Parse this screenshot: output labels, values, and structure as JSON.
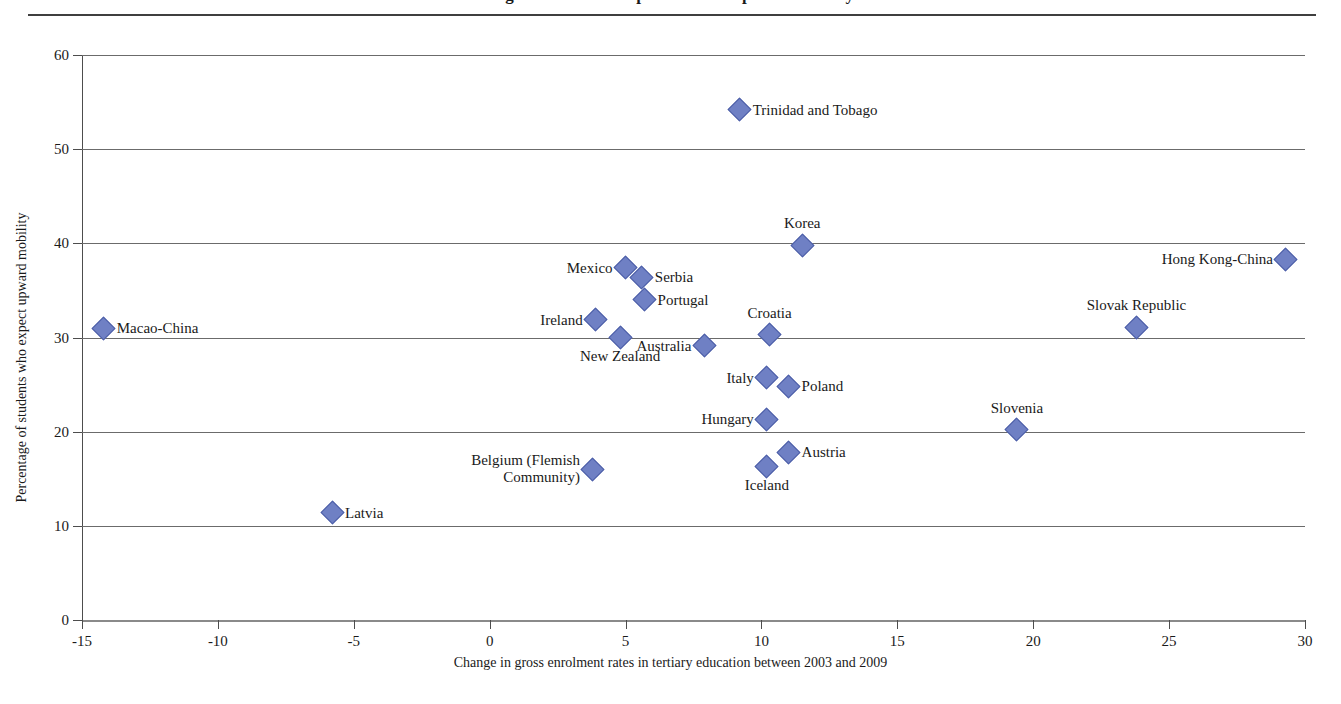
{
  "figure": {
    "title_cropped": "Figure: Students' expectations of upward mobility",
    "top_rule": true
  },
  "chart_data": {
    "type": "scatter",
    "title": "",
    "xlabel": "Change in gross enrolment rates in tertiary education between 2003 and 2009",
    "ylabel": "Percentage of students who expect upward mobility",
    "xlim": [
      -15,
      30
    ],
    "ylim": [
      0,
      60
    ],
    "xticks": [
      -15,
      -10,
      -5,
      0,
      5,
      10,
      15,
      20,
      25,
      30
    ],
    "xticklabels": [
      "-15",
      "-10",
      "-5",
      "0",
      "5",
      "10",
      "15",
      "20",
      "25",
      "30"
    ],
    "yticks": [
      0,
      10,
      20,
      30,
      40,
      50,
      60
    ],
    "yticklabels": [
      "0",
      "10",
      "20",
      "30",
      "40",
      "50",
      "60"
    ],
    "grid": "horizontal",
    "legend": "none",
    "marker": {
      "shape": "diamond",
      "color": "#6f80c4",
      "edge": "#4d5fa8",
      "size": 17
    },
    "points": [
      {
        "label": "Trinidad and Tobago",
        "x": 9.2,
        "y": 54.2,
        "label_pos": "right"
      },
      {
        "label": "Korea",
        "x": 11.5,
        "y": 39.8,
        "label_pos": "top"
      },
      {
        "label": "Hong Kong-China",
        "x": 29.3,
        "y": 38.3,
        "label_pos": "left"
      },
      {
        "label": "Mexico",
        "x": 5.0,
        "y": 37.4,
        "label_pos": "left"
      },
      {
        "label": "Serbia",
        "x": 5.6,
        "y": 36.4,
        "label_pos": "right"
      },
      {
        "label": "Portugal",
        "x": 5.7,
        "y": 34.0,
        "label_pos": "right"
      },
      {
        "label": "Ireland",
        "x": 3.9,
        "y": 31.9,
        "label_pos": "left"
      },
      {
        "label": "Slovak Republic",
        "x": 23.8,
        "y": 31.1,
        "label_pos": "top"
      },
      {
        "label": "Macao-China",
        "x": -14.2,
        "y": 31.0,
        "label_pos": "right"
      },
      {
        "label": "Croatia",
        "x": 10.3,
        "y": 30.3,
        "label_pos": "top"
      },
      {
        "label": "New Zealand",
        "x": 4.8,
        "y": 30.0,
        "label_pos": "bottom"
      },
      {
        "label": "Australia",
        "x": 7.9,
        "y": 29.1,
        "label_pos": "left"
      },
      {
        "label": "Italy",
        "x": 10.2,
        "y": 25.7,
        "label_pos": "left"
      },
      {
        "label": "Poland",
        "x": 11.0,
        "y": 24.8,
        "label_pos": "right"
      },
      {
        "label": "Hungary",
        "x": 10.2,
        "y": 21.3,
        "label_pos": "left"
      },
      {
        "label": "Slovenia",
        "x": 19.4,
        "y": 20.2,
        "label_pos": "top"
      },
      {
        "label": "Austria",
        "x": 11.0,
        "y": 17.8,
        "label_pos": "right"
      },
      {
        "label": "Iceland",
        "x": 10.2,
        "y": 16.3,
        "label_pos": "bottom"
      },
      {
        "label": "Belgium (Flemish\nCommunity)",
        "x": 3.8,
        "y": 16.0,
        "label_pos": "left-block"
      },
      {
        "label": "Latvia",
        "x": -5.8,
        "y": 11.4,
        "label_pos": "right"
      }
    ]
  }
}
